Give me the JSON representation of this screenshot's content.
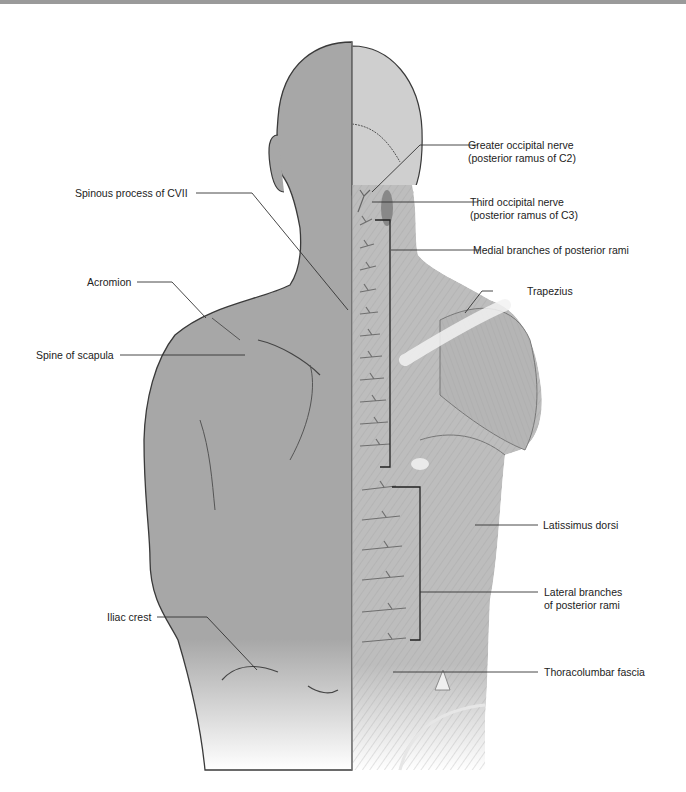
{
  "figure": {
    "colors": {
      "skin": "#a7a7a7",
      "outline": "#3a3a3a",
      "muscle": "#b9b9b9",
      "muscle_light": "#dcdcdc",
      "leader_line": "#333333",
      "top_bar": "#9a9a9a"
    }
  },
  "labels_left": [
    {
      "id": "spinous-process-cvii",
      "lines": [
        "Spinous process of CVII"
      ]
    },
    {
      "id": "acromion",
      "lines": [
        "Acromion"
      ]
    },
    {
      "id": "spine-of-scapula",
      "lines": [
        "Spine of scapula"
      ]
    },
    {
      "id": "iliac-crest",
      "lines": [
        "Iliac crest"
      ]
    }
  ],
  "labels_right": [
    {
      "id": "greater-occipital-nerve",
      "lines": [
        "Greater occipital nerve",
        "(posterior ramus of C2)"
      ]
    },
    {
      "id": "third-occipital-nerve",
      "lines": [
        "Third occipital nerve",
        "(posterior ramus of C3)"
      ]
    },
    {
      "id": "medial-branches",
      "lines": [
        "Medial branches of posterior rami"
      ]
    },
    {
      "id": "trapezius",
      "lines": [
        "Trapezius"
      ]
    },
    {
      "id": "latissimus-dorsi",
      "lines": [
        "Latissimus dorsi"
      ]
    },
    {
      "id": "lateral-branches",
      "lines": [
        "Lateral branches",
        "of posterior rami"
      ]
    },
    {
      "id": "thoracolumbar-fascia",
      "lines": [
        "Thoracolumbar fascia"
      ]
    }
  ]
}
